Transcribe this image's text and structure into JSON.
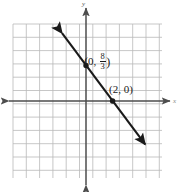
{
  "figure": {
    "title": "",
    "background_color": "#ffffff",
    "width": 179,
    "height": 192
  },
  "axes": {
    "x_axis_label": "x",
    "y_axis_label": "y",
    "axis_color": "#4d4d4d",
    "grid_color": "#b9b9b9",
    "grid_visible": true,
    "origin_px": {
      "x": 86,
      "y": 101
    },
    "cell_px": 13.3,
    "grid_bounds_px": {
      "left": 13,
      "top": 24,
      "right": 162,
      "bottom": 178
    },
    "x_range": [
      -5.5,
      5.7
    ],
    "y_range": [
      -5.8,
      5.8
    ],
    "tick_labels_visible": false
  },
  "labels": {
    "y_intercept": {
      "open": "(",
      "x_value": "0",
      "comma": ",",
      "numerator": "8",
      "denominator": "3",
      "close": ")"
    },
    "x_intercept": {
      "text": "(2, 0)"
    }
  },
  "chart_data": {
    "type": "line",
    "title": "",
    "xlabel": "x",
    "ylabel": "y",
    "xlim": [
      -5.5,
      5.7
    ],
    "ylim": [
      -5.8,
      5.8
    ],
    "grid": true,
    "legend": "none",
    "series": [
      {
        "name": "line",
        "equation": "y = -4/3 x + 8/3",
        "slope": -1.3333,
        "intercept": 2.6667,
        "color": "#1a1a1a",
        "arrows_both_ends": true,
        "endpoints": [
          {
            "x": -1.8,
            "y": 5.1
          },
          {
            "x": 4.45,
            "y": -3.27
          }
        ],
        "points": [
          {
            "x": 0,
            "y": 2.6667,
            "label": "(0, 8/3)",
            "marker": "filled-circle"
          },
          {
            "x": 2,
            "y": 0,
            "label": "(2, 0)",
            "marker": "filled-circle"
          }
        ]
      }
    ]
  }
}
